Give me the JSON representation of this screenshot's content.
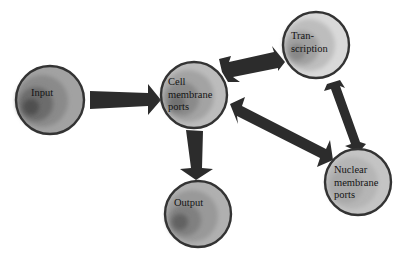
{
  "diagram": {
    "colors": {
      "background": "#ffffff",
      "arrow": "#2c2c2c",
      "node_outline": "#333333",
      "node_outer": "#b9b9b9",
      "node_mid": "#9a9a9a",
      "node_inner": "#7a7a7a",
      "node_core": "#5a5a5a",
      "text": "#141414"
    },
    "nodes": [
      {
        "id": "input",
        "label": "Input",
        "cx": 50,
        "cy": 100,
        "r": 34
      },
      {
        "id": "cell-membrane-ports",
        "label": "Cell\nmembrane\nports",
        "cx": 194,
        "cy": 95,
        "r": 33
      },
      {
        "id": "transcription",
        "label": "Tran-\nscription",
        "cx": 316,
        "cy": 45,
        "r": 33
      },
      {
        "id": "nuclear-membrane-ports",
        "label": "Nuclear\nmembrane\nports",
        "cx": 358,
        "cy": 182,
        "r": 33
      },
      {
        "id": "output",
        "label": "Output",
        "cx": 198,
        "cy": 214,
        "r": 33
      }
    ],
    "edges": [
      {
        "from": "input",
        "to": "cell-membrane-ports",
        "direction": "one-way"
      },
      {
        "from": "cell-membrane-ports",
        "to": "output",
        "direction": "one-way"
      },
      {
        "from": "cell-membrane-ports",
        "to": "transcription",
        "direction": "two-way"
      },
      {
        "from": "cell-membrane-ports",
        "to": "nuclear-membrane-ports",
        "direction": "two-way"
      },
      {
        "from": "transcription",
        "to": "nuclear-membrane-ports",
        "direction": "two-way"
      }
    ]
  }
}
